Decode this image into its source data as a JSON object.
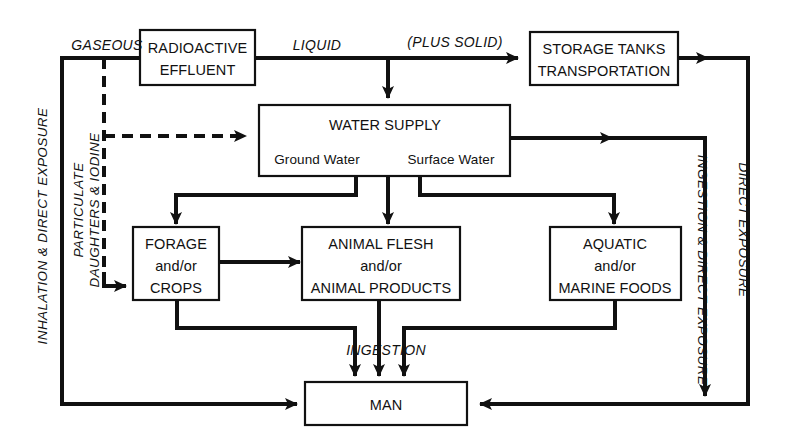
{
  "diagram": {
    "colors": {
      "ink": "#111111",
      "background": "#ffffff"
    },
    "nodes": [
      {
        "id": "radioactive-effluent",
        "lines": [
          "RADIOACTIVE",
          "EFFLUENT"
        ]
      },
      {
        "id": "storage-tanks",
        "lines": [
          "STORAGE TANKS",
          "TRANSPORTATION"
        ]
      },
      {
        "id": "water-supply",
        "lines": [
          "WATER SUPPLY"
        ],
        "sub_left": "Ground Water",
        "sub_right": "Surface Water"
      },
      {
        "id": "forage-crops",
        "lines": [
          "FORAGE",
          "and/or",
          "CROPS"
        ]
      },
      {
        "id": "animal-flesh",
        "lines": [
          "ANIMAL FLESH",
          "and/or",
          "ANIMAL PRODUCTS"
        ]
      },
      {
        "id": "aquatic-foods",
        "lines": [
          "AQUATIC",
          "and/or",
          "MARINE FOODS"
        ]
      },
      {
        "id": "man",
        "lines": [
          "MAN"
        ]
      }
    ],
    "edge_labels": {
      "gaseous": "GASEOUS",
      "liquid": "LIQUID",
      "plus_solid": "(PLUS SOLID)",
      "ingestion": "INGESTION",
      "particulate_line1": "PARTICULATE",
      "particulate_line2": "DAUGHTERS & IODINE",
      "inhalation_direct": "INHALATION & DIRECT EXPOSURE",
      "ingestion_direct": "INGESTION & DIRECT EXPOSURE",
      "direct_exposure": "DIRECT EXPOSURE"
    }
  }
}
